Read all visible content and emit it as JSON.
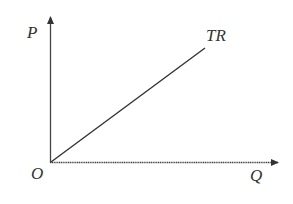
{
  "diagram": {
    "type": "economics-total-revenue",
    "colors": {
      "line": "#333333",
      "axis": "#444444",
      "background": "#ffffff"
    },
    "axes": {
      "y_label": "P",
      "x_label": "Q",
      "origin_label": "O"
    },
    "curve": {
      "label": "TR",
      "shape": "straight line from origin, upward sloping"
    }
  }
}
